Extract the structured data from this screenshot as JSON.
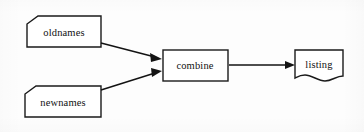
{
  "diagram": {
    "background_color": "#fdfdfd",
    "stroke_color": "#131313",
    "fill_color": "#ffffff",
    "nodes": [
      {
        "id": "oldnames",
        "label": "oldnames",
        "shape": "clipped-corner-rectangle",
        "role": "input-file",
        "x": 27,
        "y": 16,
        "width": 74,
        "height": 31,
        "center_x": 64,
        "center_y": 32
      },
      {
        "id": "newnames",
        "label": "newnames",
        "shape": "clipped-corner-rectangle",
        "role": "input-file",
        "x": 25,
        "y": 86,
        "width": 76,
        "height": 31,
        "center_x": 63,
        "center_y": 102
      },
      {
        "id": "combine",
        "label": "combine",
        "shape": "rectangle",
        "role": "process",
        "x": 163,
        "y": 50,
        "width": 65,
        "height": 31,
        "center_x": 195,
        "center_y": 65
      },
      {
        "id": "listing",
        "label": "listing",
        "shape": "document-wavy-bottom",
        "role": "output-document",
        "x": 295,
        "y": 50,
        "width": 48,
        "height": 31,
        "center_x": 319,
        "center_y": 65
      }
    ],
    "edges": [
      {
        "id": "oldnames-to-combine",
        "from": "oldnames",
        "to": "combine",
        "label": "",
        "arrowhead": "filled-triangle",
        "x1": 101,
        "y1": 43,
        "x2": 162,
        "y2": 59
      },
      {
        "id": "newnames-to-combine",
        "from": "newnames",
        "to": "combine",
        "label": "",
        "arrowhead": "filled-triangle",
        "x1": 101,
        "y1": 90,
        "x2": 162,
        "y2": 71
      },
      {
        "id": "combine-to-listing",
        "from": "combine",
        "to": "listing",
        "label": "",
        "arrowhead": "filled-triangle",
        "x1": 229,
        "y1": 65,
        "x2": 294,
        "y2": 65
      }
    ]
  }
}
